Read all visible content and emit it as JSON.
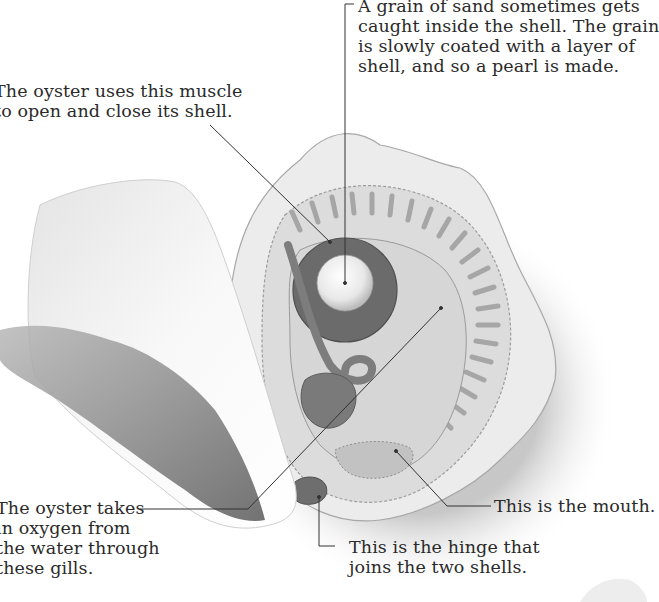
{
  "diagram": {
    "colors": {
      "background": "#ffffff",
      "shell_outer": "#ececec",
      "mantle_frill": "#dcdcdc",
      "gills": "#cfcfcf",
      "body": "#d6d6d6",
      "muscle": "#6b6b6b",
      "pearl": "#f4f4f4",
      "organs": "#7a7a7a",
      "leader_line": "#333333",
      "text": "#2a2a2a"
    },
    "labels": {
      "pearl": {
        "lines": [
          "A grain of sand sometimes gets",
          "caught inside the shell. The grain",
          "is slowly coated with a layer of",
          "shell, and so a pearl is made."
        ]
      },
      "muscle": {
        "lines": [
          "The oyster uses this muscle",
          "to open and close its shell."
        ]
      },
      "gills": {
        "lines": [
          "The oyster takes",
          "in oxygen from",
          "the water through",
          "these gills."
        ]
      },
      "mouth": {
        "lines": [
          "This is the mouth."
        ]
      },
      "hinge": {
        "lines": [
          "This is the hinge that",
          "joins the two shells."
        ]
      }
    }
  }
}
